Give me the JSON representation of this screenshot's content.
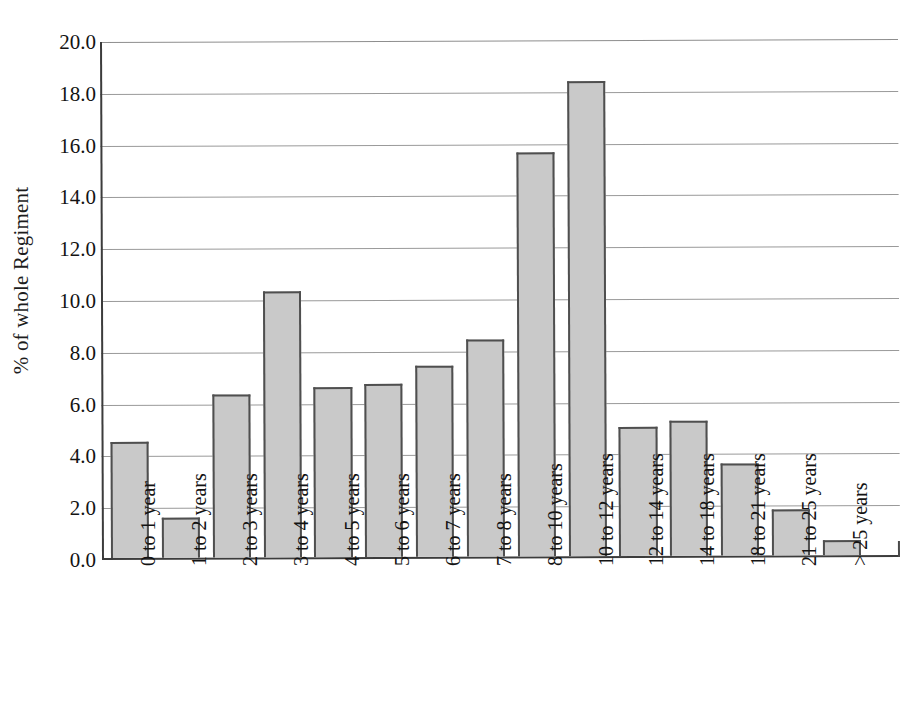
{
  "chart_data": {
    "type": "bar",
    "title": "",
    "subtitle": "",
    "xlabel": "",
    "ylabel": "% of whole Regiment",
    "ylim": [
      0.0,
      20.0
    ],
    "ytick_step": 2.0,
    "ytick_labels": [
      "20.0",
      "18.0",
      "16.0",
      "14.0",
      "12.0",
      "10.0",
      "8.0",
      "6.0",
      "4.0",
      "2.0",
      "0.0"
    ],
    "ytick_values": [
      20.0,
      18.0,
      16.0,
      14.0,
      12.0,
      10.0,
      8.0,
      6.0,
      4.0,
      2.0,
      0.0
    ],
    "grid": true,
    "grid_axis": "y",
    "legend": false,
    "legend_position": "none",
    "categories": [
      "0 to 1 year",
      "1 to 2 years",
      "2 to 3 years",
      "3 to 4 years",
      "4 to 5 years",
      "5 to 6 years",
      "6 to 7 years",
      "7 to 8 years",
      "8 to 10 years",
      "10 to 12 years",
      "12 to 14 years",
      "14 to 18 years",
      "18 to 21 years",
      "21 to 25 years",
      "> 25 years"
    ],
    "values": [
      4.5,
      1.55,
      6.3,
      10.3,
      6.6,
      6.7,
      7.4,
      8.4,
      15.65,
      18.4,
      5.0,
      5.25,
      3.55,
      1.8,
      0.6
    ],
    "bar_fill_color": "#c9c9c9",
    "bar_border_color": "#4f4f4f",
    "gridline_color": "#9a9a9a",
    "axis_color": "#3c3c3c",
    "background_color": "#ffffff"
  }
}
